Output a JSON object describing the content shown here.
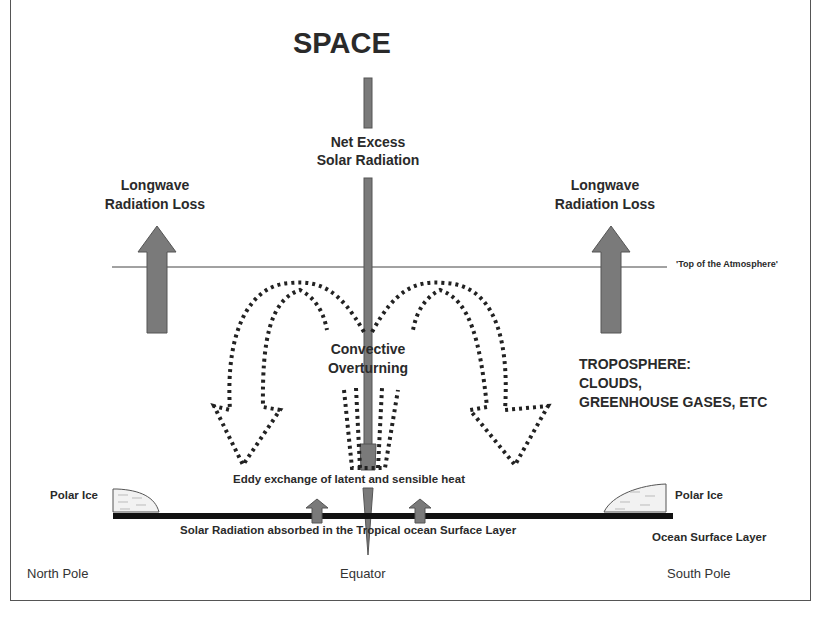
{
  "diagram": {
    "title": "SPACE",
    "central_beam": {
      "label_line1": "Net Excess",
      "label_line2": "Solar Radiation"
    },
    "longwave_left": {
      "line1": "Longwave",
      "line2": "Radiation Loss"
    },
    "longwave_right": {
      "line1": "Longwave",
      "line2": "Radiation Loss"
    },
    "toa_label": "'Top of the Atmosphere'",
    "convective": {
      "line1": "Convective",
      "line2": "Overturning"
    },
    "troposphere": {
      "line1": "TROPOSPHERE:",
      "line2": "CLOUDS,",
      "line3": "GREENHOUSE GASES, ETC"
    },
    "eddy_label": "Eddy exchange of latent and sensible heat",
    "surface_label": "Solar Radiation absorbed in the Tropical ocean Surface Layer",
    "polar_ice_left": "Polar Ice",
    "polar_ice_right": "Polar Ice",
    "ocean_layer": "Ocean Surface Layer",
    "axis": {
      "north": "North Pole",
      "equator": "Equator",
      "south": "South Pole"
    },
    "colors": {
      "arrow_fill": "#7a7a7a",
      "arrow_stroke": "#555555",
      "ocean": "#111111",
      "dots": "#222222"
    }
  }
}
